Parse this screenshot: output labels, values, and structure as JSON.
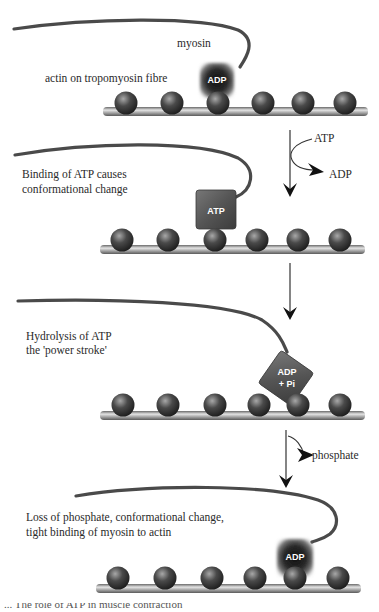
{
  "figure": {
    "panels": [
      {
        "id": "rest",
        "labels": [
          "myosin",
          "actin on tropomyosin fibre"
        ],
        "head_label": "ADP",
        "head_state": "bound-fuzzy"
      },
      {
        "id": "atp-binding",
        "labels": [
          "Binding of ATP causes",
          "conformational change"
        ],
        "head_label": "ATP",
        "head_state": "square"
      },
      {
        "id": "hydrolysis",
        "labels": [
          "Hydrolysis of ATP",
          "the 'power stroke'"
        ],
        "head_label_line1": "ADP",
        "head_label_line2": "+ Pi",
        "head_state": "tilted"
      },
      {
        "id": "phosphate-loss",
        "labels": [
          "Loss of phosphate, conformational change,",
          "tight binding of myosin to actin"
        ],
        "head_label": "ADP",
        "head_state": "bound-fuzzy"
      }
    ],
    "transitions": [
      {
        "in": "ATP",
        "out": "ADP"
      },
      {
        "in": "",
        "out": ""
      },
      {
        "in": "",
        "out": "phosphate"
      }
    ],
    "caption_partial": "... The role of ATP in muscle contraction"
  },
  "colors": {
    "myosin": "#4a4a4a",
    "actin_ball": "#3c3c3c",
    "rod": "#8a8a8a",
    "head": "#5a5a5a",
    "text": "#2a2a2a"
  }
}
